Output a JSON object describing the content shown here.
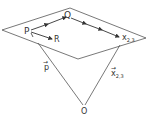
{
  "diagram": {
    "colors": {
      "line": "#555555",
      "text": "#333333",
      "background": "#ffffff"
    },
    "plane": {
      "points": "2,30 70,8 146,38 78,59"
    },
    "points": {
      "Q": {
        "label": "Q",
        "x": 68,
        "y": 13
      },
      "P": {
        "label": "P",
        "x": 30,
        "y": 31
      },
      "R": {
        "label": "R",
        "x": 55,
        "y": 39
      },
      "X": {
        "label": "x",
        "sub": "2,3",
        "x": 120,
        "y": 38
      },
      "O": {
        "label": "O",
        "x": 84,
        "y": 110
      }
    },
    "vectors": {
      "p": {
        "label": "p",
        "arrow": "→"
      },
      "x23": {
        "label": "x",
        "sub": "2,3",
        "arrow": "→"
      }
    }
  }
}
